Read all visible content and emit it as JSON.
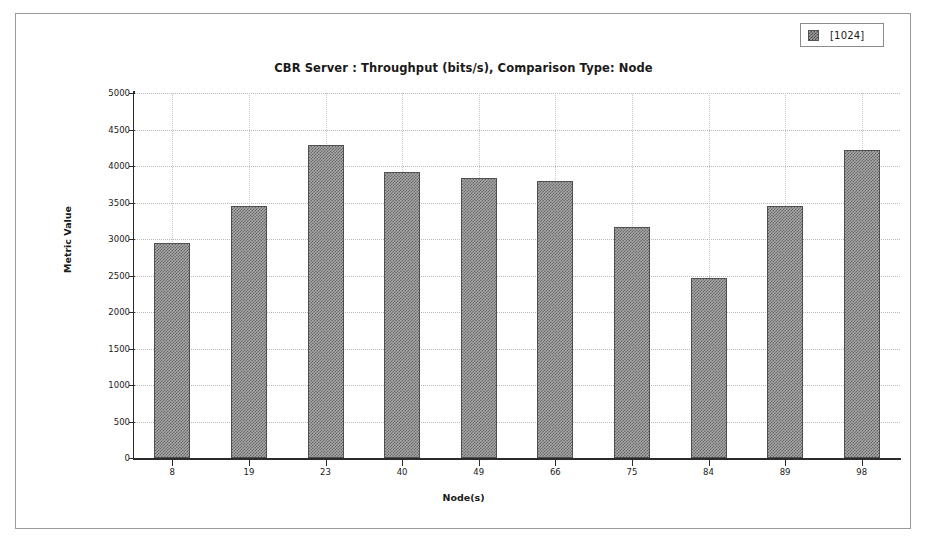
{
  "chart_data": {
    "type": "bar",
    "title": "CBR Server :  Throughput (bits/s), Comparison Type: Node",
    "xlabel": "Node(s)",
    "ylabel": "Metric Value",
    "categories": [
      "8",
      "19",
      "23",
      "40",
      "49",
      "66",
      "75",
      "84",
      "89",
      "98"
    ],
    "values": [
      2940,
      3450,
      4290,
      3920,
      3840,
      3790,
      3170,
      2460,
      3450,
      4220
    ],
    "series": [
      {
        "name": "[1024]",
        "values": [
          2940,
          3450,
          4290,
          3920,
          3840,
          3790,
          3170,
          2460,
          3450,
          4220
        ]
      }
    ],
    "ylim": [
      0,
      5000
    ],
    "ytick_labels": [
      "0",
      "500",
      "1000",
      "1500",
      "2000",
      "2500",
      "3000",
      "3500",
      "4000",
      "4500",
      "5000"
    ],
    "ytick_values": [
      0,
      500,
      1000,
      1500,
      2000,
      2500,
      3000,
      3500,
      4000,
      4500,
      5000
    ],
    "grid": true,
    "legend_position": "top-right",
    "bar_color": "#a6a6a6",
    "bar_border_color": "#4f4f4f",
    "grid_color": "#b9b9b9",
    "axis_color": "#2b2b2b"
  },
  "legend": {
    "entries": [
      {
        "label": "[1024]",
        "swatch_color": "#9e9e9e"
      }
    ]
  }
}
